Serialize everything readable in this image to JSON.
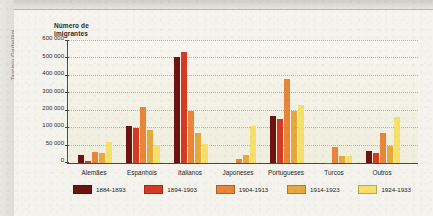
{
  "credit": "Tarcisio Garbellini",
  "top_strip_ghost_text": "",
  "axis_title": "Número de\nimigrantes",
  "chart_data": {
    "type": "bar",
    "title": "",
    "subtitle": "",
    "xlabel": "",
    "ylabel": "Número de imigrantes",
    "grid": true,
    "legend_position": "bottom",
    "ylim": [
      0,
      600000
    ],
    "ytick_labels": [
      "0",
      "50 000",
      "100 000",
      "200 000",
      "300 000",
      "400 000",
      "500 000",
      "600 000"
    ],
    "ytick_values": [
      0,
      50000,
      100000,
      200000,
      300000,
      400000,
      500000,
      600000
    ],
    "categories": [
      "Alemães",
      "Espanhóis",
      "Italianos",
      "Japoneses",
      "Portugueses",
      "Turcos",
      "Outros"
    ],
    "series": [
      {
        "name": "1884-1893",
        "color": "#6e1410",
        "values": [
          22000,
          113000,
          510000,
          0,
          170000,
          0,
          35000
        ]
      },
      {
        "name": "1894-1903",
        "color": "#d53a22",
        "values": [
          6000,
          102000,
          537000,
          0,
          155000,
          1000,
          30000
        ]
      },
      {
        "name": "1904-1913",
        "color": "#e8853a",
        "values": [
          33000,
          224000,
          196000,
          12000,
          384000,
          45000,
          86000
        ]
      },
      {
        "name": "1914-1923",
        "color": "#e6a83f",
        "values": [
          29000,
          94000,
          86000,
          22000,
          201000,
          20000,
          48000
        ]
      },
      {
        "name": "1924-1933",
        "color": "#f4e06a",
        "values": [
          61000,
          52000,
          55000,
          110000,
          233000,
          20000,
          164000
        ]
      }
    ]
  }
}
